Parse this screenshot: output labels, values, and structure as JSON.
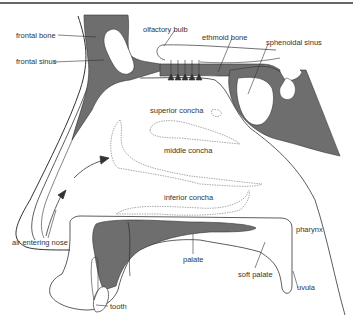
{
  "diagram": {
    "type": "anatomical cross-section",
    "colors": {
      "bone": "#6e6e6e",
      "outline": "#333333",
      "concha": "#bdbdbd",
      "background": "#ffffff"
    },
    "labels": {
      "frontal_bone": "frontal bone",
      "frontal_sinus": "frontal sinus",
      "olfactory_bulb": "olfactory bulb",
      "ethmoid_bone": "ethmoid bone",
      "sphenoidal_sinus": "sphenoidal sinus",
      "superior_concha": "superior concha",
      "middle_concha": "middle concha",
      "inferior_concha": "inferior concha",
      "air_entering_nose": "air entering nose",
      "palate": "palate",
      "soft_palate": "soft palate",
      "pharynx": "pharynx",
      "uvula": "uvula",
      "tooth": "tooth"
    }
  }
}
